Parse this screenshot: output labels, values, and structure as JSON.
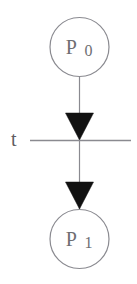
{
  "diagram": {
    "type": "petri-net",
    "background_color": "#ffffff",
    "stroke_color": "#8a8a90",
    "arrow_fill_color": "#111111",
    "text_color": "#6e6e72",
    "places": [
      {
        "id": "p0",
        "label_main": "P",
        "label_sub": "0",
        "label_full": "P0",
        "cx": 79.5,
        "cy": 47,
        "r": 29.5
      },
      {
        "id": "p1",
        "label_main": "P",
        "label_sub": "1",
        "label_full": "P1",
        "cx": 79.5,
        "cy": 239,
        "r": 29.5
      }
    ],
    "transitions": [
      {
        "id": "t",
        "label": "t",
        "label_x": 11,
        "label_y": 146,
        "bar_x1": 30,
        "bar_x2": 131,
        "bar_y": 140.5
      }
    ],
    "arcs": [
      {
        "id": "arc-p0-to-t",
        "from": "p0",
        "to": "t",
        "x": 79.5,
        "y1": 77,
        "y2": 140,
        "arrowhead": "filled-triangle-down",
        "arrow_tip_y": 140,
        "arrow_base_y": 113,
        "arrow_half_width": 14
      },
      {
        "id": "arc-t-to-p1",
        "from": "t",
        "to": "p1",
        "x": 79.5,
        "y1": 141,
        "y2": 210,
        "arrowhead": "filled-triangle-down",
        "arrow_tip_y": 209,
        "arrow_base_y": 182,
        "arrow_half_width": 14
      }
    ]
  }
}
